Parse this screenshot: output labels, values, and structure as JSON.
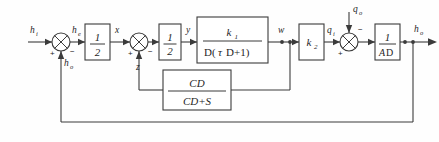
{
  "diagram": {
    "type": "control-system-block-diagram",
    "background_color": "#fefefe",
    "line_color": "#3b3b3b",
    "signals": {
      "input": "h",
      "input_sub": "i",
      "error": "h",
      "error_sub": "e",
      "x": "x",
      "z": "z",
      "y": "y",
      "w": "w",
      "qi": "q",
      "qi_sub": "i",
      "qo": "q",
      "qo_sub": "o",
      "output": "h",
      "output_sub": "o",
      "feedback": "h",
      "feedback_sub": "o"
    },
    "blocks": [
      {
        "name": "gain-half-1",
        "numerator": "1",
        "denominator": "2"
      },
      {
        "name": "gain-half-2",
        "numerator": "1",
        "denominator": "2"
      },
      {
        "name": "plant-k1",
        "numerator": "k",
        "numerator_sub": "1",
        "denominator": "D( D+1)",
        "denominator_pre": "D(",
        "denominator_tau": "τ",
        "denominator_post": "D+1)"
      },
      {
        "name": "gain-k2",
        "label": "k",
        "label_sub": "2"
      },
      {
        "name": "integrator",
        "numerator": "1",
        "denominator": "AD",
        "denominator_italic": "A",
        "denominator_rest": "D"
      },
      {
        "name": "feedback-cd",
        "numerator": "CD",
        "denominator": "CD+S"
      }
    ],
    "summing_junctions": [
      {
        "name": "sum-1",
        "left_sign": "+",
        "right_sign": "−",
        "bottom_sign": ""
      },
      {
        "name": "sum-2",
        "left_sign": "+",
        "right_sign": "−",
        "bottom_sign": ""
      },
      {
        "name": "sum-3",
        "left_sign": "+",
        "right_sign": "−",
        "bottom_sign": ""
      }
    ]
  }
}
